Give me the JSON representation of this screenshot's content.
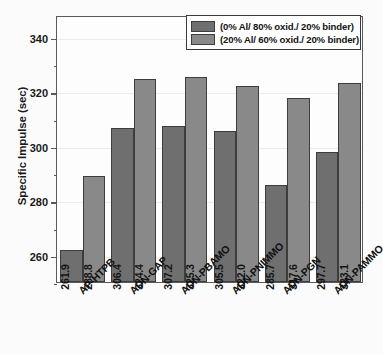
{
  "chart_data": {
    "type": "bar",
    "title": "",
    "xlabel": "",
    "ylabel": "Specific Impulse (sec)",
    "ylim": [
      250,
      348
    ],
    "yticks": [
      260,
      280,
      300,
      320,
      340
    ],
    "ytick_labels": [
      "260",
      "280",
      "300",
      "320",
      "340"
    ],
    "minor_ticks": [
      250,
      270,
      290,
      310,
      330
    ],
    "grid": true,
    "legend_position": "top-right",
    "categories": [
      "AP-HTPB",
      "ADN-GAP",
      "ADN-PBAMO",
      "ADN-PNIMMO",
      "ADN-PGN",
      "ADN-PAMMO"
    ],
    "series": [
      {
        "name": "(0% Al/ 80% oxid./ 20% binder)",
        "color": "#6f6f6f",
        "values": [
          261.9,
          306.4,
          307.2,
          305.5,
          285.7,
          297.7
        ],
        "labels": [
          "261.9",
          "306.4",
          "307.2",
          "305.5",
          "285.7",
          "297.7"
        ]
      },
      {
        "name": "(20% Al/ 60% oxid./ 20% binder)",
        "color": "#898989",
        "values": [
          288.8,
          324.4,
          325.3,
          322.0,
          317.6,
          323.1
        ],
        "labels": [
          "288.8",
          "324.4",
          "325.3",
          "322.0",
          "317.6",
          "323.1"
        ]
      }
    ]
  },
  "colors": {
    "series_dark": "#6f6f6f",
    "series_light": "#898989",
    "axis": "#5a5a5a",
    "background": "#fbfbfb",
    "grid": "#ececec",
    "text": "#141414"
  }
}
